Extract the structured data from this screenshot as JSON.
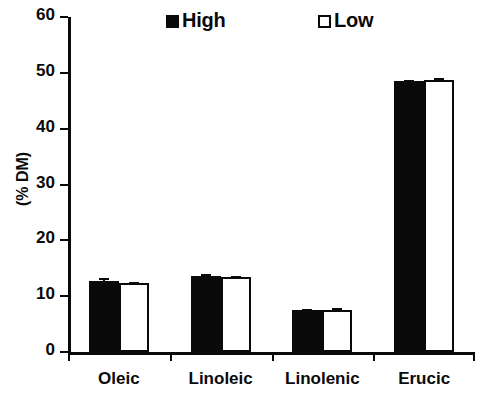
{
  "chart_data": {
    "type": "bar",
    "title": "",
    "xlabel": "",
    "ylabel": "(% DM)",
    "ylim": [
      0,
      60
    ],
    "ytick_values": [
      0,
      10,
      20,
      30,
      40,
      50,
      60
    ],
    "ytick_labels": [
      "0",
      "10",
      "20",
      "30",
      "40",
      "50",
      "60"
    ],
    "grid": false,
    "legend_position": "top-center",
    "categories": [
      "Oleic",
      "Linoleic",
      "Linolenic",
      "Erucic"
    ],
    "series": [
      {
        "name": "High",
        "style": "filled-black",
        "color": "#0a0a0a",
        "values": [
          12.8,
          13.7,
          7.5,
          48.5
        ],
        "errors": [
          0.5,
          0.3,
          0.2,
          0.3
        ]
      },
      {
        "name": "Low",
        "style": "open-white",
        "color": "#ffffff",
        "values": [
          12.3,
          13.5,
          7.6,
          48.8
        ],
        "errors": [
          0.3,
          0.2,
          0.3,
          0.2
        ]
      }
    ]
  },
  "legend": {
    "entries": [
      {
        "label": "High",
        "marker": "filled-square-marker"
      },
      {
        "label": "Low",
        "marker": "open-square-marker"
      }
    ]
  },
  "axes": {
    "y_axis_label": "(% DM)"
  }
}
